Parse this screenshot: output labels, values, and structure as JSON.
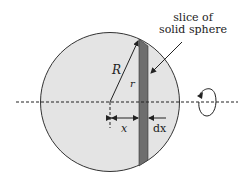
{
  "diagram": {
    "title_line1": "slice of",
    "title_line2": "solid sphere",
    "labels": {
      "big_radius": "R",
      "small_radius": "r",
      "distance": "x",
      "thickness": "dx"
    },
    "colors": {
      "sphere_fill": "#e4e4e4",
      "sphere_stroke": "#333333",
      "slice_fill": "#6e6e6e",
      "line": "#222222",
      "background": "#ffffff"
    },
    "icons": {
      "rotation": "rotation-arrow-icon"
    }
  }
}
